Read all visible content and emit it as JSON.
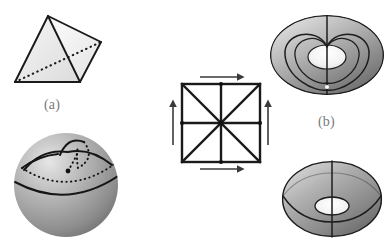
{
  "figure": {
    "background": "#ffffff",
    "width": 385,
    "height": 244,
    "captions": [
      {
        "id": "a",
        "label": "(a)",
        "x": 44,
        "y": 97,
        "color": "#7a7a7a"
      },
      {
        "id": "b",
        "label": "(b)",
        "x": 318,
        "y": 114,
        "color": "#7a7a7a"
      }
    ],
    "palette": {
      "stroke": "#1a1a1a",
      "face_light": "#f2f2f2",
      "face_mid": "#e2e2e2",
      "face_dark": "#d2d2d2",
      "sphere_light": "#d9d9d9",
      "sphere_mid": "#9e9e9e",
      "sphere_dark": "#6f6f6f",
      "torus_light": "#e0e0e0",
      "torus_mid": "#9a9a9a",
      "torus_dark": "#5e5e5e",
      "arrow": "#3a3a3a",
      "caption": "#7a7a7a"
    },
    "panels": [
      {
        "name": "tetrahedron",
        "kind": "polyhedron",
        "description": "Tetrahedron with one hidden edge drawn dashed",
        "vertices": [
          {
            "name": "apex",
            "x": 48,
            "y": 16
          },
          {
            "name": "front-left",
            "x": 15,
            "y": 82
          },
          {
            "name": "front-right",
            "x": 80,
            "y": 82
          },
          {
            "name": "back-right",
            "x": 101,
            "y": 42
          }
        ],
        "edges": [
          {
            "from": "apex",
            "to": "front-left",
            "style": "solid"
          },
          {
            "from": "apex",
            "to": "front-right",
            "style": "solid"
          },
          {
            "from": "apex",
            "to": "back-right",
            "style": "solid"
          },
          {
            "from": "front-left",
            "to": "front-right",
            "style": "solid"
          },
          {
            "from": "front-right",
            "to": "back-right",
            "style": "solid"
          },
          {
            "from": "front-left",
            "to": "back-right",
            "style": "dashed"
          }
        ],
        "face_count": 4,
        "edge_count": 6,
        "vertex_count": 4
      },
      {
        "name": "triangulated-sphere",
        "kind": "sphere",
        "description": "Shaded sphere with a curvilinear triangulation; hidden arcs dashed",
        "center": {
          "x": 66,
          "y": 185
        },
        "radius": 52,
        "arcs": [
          {
            "name": "equator",
            "style": "solid"
          },
          {
            "name": "upper-latitude",
            "style": "solid"
          },
          {
            "name": "upper-latitude-back",
            "style": "dashed"
          },
          {
            "name": "meridian-left",
            "style": "solid"
          },
          {
            "name": "meridian-right",
            "style": "solid"
          },
          {
            "name": "meridian-back",
            "style": "dashed"
          },
          {
            "name": "cap-arc",
            "style": "solid"
          },
          {
            "name": "cap-arc-back",
            "style": "dashed"
          }
        ],
        "node": {
          "x": 68,
          "y": 171
        }
      },
      {
        "name": "identified-square",
        "kind": "polygon-identification",
        "description": "Square with triangulated interior (two diagonals plus mid-lines) and edge-identification arrows forming a torus",
        "square": {
          "x": 182,
          "y": 84,
          "size": 78
        },
        "interior_lines": [
          "diagonal-tl-br",
          "diagonal-tr-bl",
          "horizontal-midline",
          "vertical-midline"
        ],
        "triangle_count": 8,
        "arrows": [
          {
            "name": "top-edge-arrow",
            "direction": "right",
            "x": 200,
            "y": 77,
            "length": 44,
            "pairs_with": "bottom-edge-arrow"
          },
          {
            "name": "bottom-edge-arrow",
            "direction": "right",
            "x": 200,
            "y": 168,
            "length": 44,
            "pairs_with": "top-edge-arrow"
          },
          {
            "name": "left-edge-arrow",
            "direction": "up",
            "x": 173,
            "y": 101,
            "length": 44,
            "pairs_with": "right-edge-arrow"
          },
          {
            "name": "right-edge-arrow",
            "direction": "up",
            "x": 268,
            "y": 101,
            "length": 44,
            "pairs_with": "left-edge-arrow"
          }
        ],
        "midpoint_nodes": [
          {
            "x": 221,
            "y": 84
          },
          {
            "x": 221,
            "y": 162
          },
          {
            "x": 182,
            "y": 123
          },
          {
            "x": 260,
            "y": 123
          },
          {
            "x": 221,
            "y": 123
          }
        ]
      },
      {
        "name": "torus-top",
        "kind": "torus",
        "description": "Shaded torus seen from above with the identified square edges drawn as a heart-shaped curve through the hole plus a meridian circle",
        "center": {
          "x": 327,
          "y": 55
        },
        "outer_rx": 57,
        "outer_ry": 40,
        "hole_rx": 19,
        "hole_ry": 12,
        "curves": [
          "meridian-vertical",
          "heart-curve-outer",
          "heart-curve-inner"
        ],
        "marker": {
          "x": 327,
          "y": 86
        }
      },
      {
        "name": "torus-bottom",
        "kind": "torus",
        "description": "Shaded torus seen nearly edge-on with a meridian circle and a latitude circle",
        "center": {
          "x": 332,
          "y": 199
        },
        "outer_rx": 50,
        "outer_ry": 38,
        "hole_rx": 16,
        "hole_ry": 9,
        "curves": [
          "meridian-vertical",
          "latitude-circle"
        ]
      }
    ]
  }
}
